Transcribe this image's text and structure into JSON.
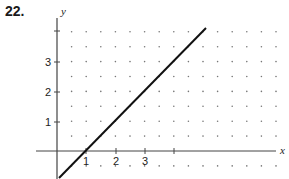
{
  "problem_number": "22.",
  "chart_data": {
    "type": "line",
    "title": "",
    "xlabel": "x",
    "ylabel": "y",
    "x_ticks": [
      "1",
      "2",
      "3"
    ],
    "y_ticks": [
      "1",
      "2",
      "3"
    ],
    "grid": "dotted (half-unit spacing)",
    "xlim": [
      -0.7,
      7.6
    ],
    "ylim": [
      -1,
      4.5
    ],
    "series": [
      {
        "name": "line",
        "x": [
          0.05,
          5.15
        ],
        "y": [
          -0.95,
          4.15
        ],
        "equation": "y = x - 1"
      }
    ],
    "legend": "none"
  },
  "axes": {
    "x_label": "x",
    "y_label": "y",
    "x_tick_labels": [
      "1",
      "2",
      "3"
    ],
    "y_tick_labels": [
      "1",
      "2",
      "3"
    ]
  }
}
